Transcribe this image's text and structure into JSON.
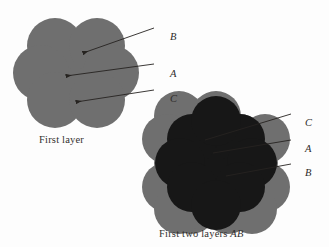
{
  "figure": {
    "background_color": "#fdfdfd",
    "captions": {
      "first_layer": "First layer",
      "first_two_layers_prefix": "First two layers ",
      "first_two_layers_italic": "AB"
    },
    "colors": {
      "layer_a_gray": "#6f6f6f",
      "layer_b_dark": "#171717",
      "leader_line": "#262320",
      "label_text": "#2e2b29"
    }
  },
  "diagram_first_layer": {
    "name": "first-layer-hexagonal-close-packing",
    "circle_radius": 28,
    "circles": [
      {
        "id": "a-center",
        "cx": 69,
        "cy": 73,
        "layer": "A"
      },
      {
        "id": "a-top-left",
        "cx": 55,
        "cy": 46,
        "layer": "A"
      },
      {
        "id": "a-top-right",
        "cx": 97,
        "cy": 46,
        "layer": "A"
      },
      {
        "id": "a-left",
        "cx": 41,
        "cy": 73,
        "layer": "A"
      },
      {
        "id": "a-right",
        "cx": 111,
        "cy": 73,
        "layer": "A"
      },
      {
        "id": "a-bottom-left",
        "cx": 55,
        "cy": 100,
        "layer": "A"
      },
      {
        "id": "a-bottom-right",
        "cx": 97,
        "cy": 100,
        "layer": "A"
      }
    ],
    "annotations": [
      {
        "label": "B",
        "label_x": 170,
        "label_y": 31,
        "line_x1": 154,
        "line_y1": 28,
        "line_x2": 83,
        "line_y2": 53
      },
      {
        "label": "A",
        "label_x": 170,
        "label_y": 68,
        "line_x1": 154,
        "line_y1": 64,
        "line_x2": 66,
        "line_y2": 76
      },
      {
        "label": "C",
        "label_x": 170,
        "label_y": 93,
        "line_x1": 154,
        "line_y1": 90,
        "line_x2": 76,
        "line_y2": 102
      }
    ]
  },
  "diagram_first_two_layers": {
    "name": "first-two-layers-ab-close-packing",
    "circle_radius": 25,
    "layer_a_circles": [
      {
        "id": "a-center",
        "cx": 216,
        "cy": 163
      },
      {
        "id": "a-top-left",
        "cx": 203,
        "cy": 139
      },
      {
        "id": "a-top-right",
        "cx": 240,
        "cy": 139
      },
      {
        "id": "a-upper-left",
        "cx": 179,
        "cy": 163
      },
      {
        "id": "a-upper-right",
        "cx": 253,
        "cy": 163
      },
      {
        "id": "a-bottom-left",
        "cx": 203,
        "cy": 187
      },
      {
        "id": "a-bottom-right",
        "cx": 240,
        "cy": 187
      },
      {
        "id": "a-far-top-left",
        "cx": 179,
        "cy": 116
      },
      {
        "id": "a-far-top-right",
        "cx": 216,
        "cy": 116
      },
      {
        "id": "a-far-left-upper",
        "cx": 167,
        "cy": 139
      },
      {
        "id": "a-far-right-upper",
        "cx": 265,
        "cy": 139
      },
      {
        "id": "a-far-left-lower",
        "cx": 167,
        "cy": 187
      },
      {
        "id": "a-far-right-lower",
        "cx": 265,
        "cy": 187
      },
      {
        "id": "a-far-bottom-left",
        "cx": 191,
        "cy": 209
      },
      {
        "id": "a-far-bottom-right",
        "cx": 228,
        "cy": 209
      },
      {
        "id": "a-far-bottom-mid",
        "cx": 252,
        "cy": 209
      },
      {
        "id": "a-far-bottom-edge",
        "cx": 179,
        "cy": 209
      }
    ],
    "layer_b_circles": [
      {
        "id": "b-center",
        "cx": 216,
        "cy": 163
      },
      {
        "id": "b-top-left",
        "cx": 192,
        "cy": 139
      },
      {
        "id": "b-top-right",
        "cx": 240,
        "cy": 139
      },
      {
        "id": "b-left",
        "cx": 180,
        "cy": 163
      },
      {
        "id": "b-right",
        "cx": 252,
        "cy": 163
      },
      {
        "id": "b-bottom-left",
        "cx": 192,
        "cy": 187
      },
      {
        "id": "b-bottom-right",
        "cx": 240,
        "cy": 187
      },
      {
        "id": "b-top-mid",
        "cx": 216,
        "cy": 121
      },
      {
        "id": "b-bottom-mid",
        "cx": 216,
        "cy": 205
      }
    ],
    "annotations": [
      {
        "label": "C",
        "label_x": 305,
        "label_y": 117,
        "line_x1": 291,
        "line_y1": 114,
        "line_x2": 205,
        "line_y2": 140
      },
      {
        "label": "A",
        "label_x": 305,
        "label_y": 143,
        "line_x1": 291,
        "line_y1": 140,
        "line_x2": 213,
        "line_y2": 153
      },
      {
        "label": "B",
        "label_x": 305,
        "label_y": 167,
        "line_x1": 291,
        "line_y1": 164,
        "line_x2": 226,
        "line_y2": 176
      }
    ]
  }
}
